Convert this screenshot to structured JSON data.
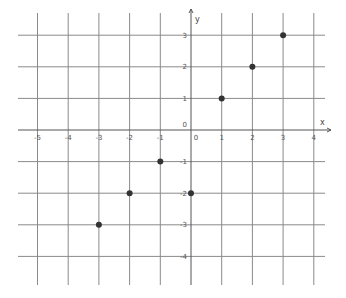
{
  "chart_data": {
    "type": "scatter",
    "title": "",
    "xlabel": "x",
    "ylabel": "y",
    "xlim": [
      -5.7,
      4.4
    ],
    "ylim": [
      -4.9,
      3.7
    ],
    "grid": true,
    "x_ticks": [
      -5,
      -4,
      -3,
      -2,
      -1,
      0,
      1,
      2,
      3,
      4
    ],
    "y_ticks": [
      3,
      2,
      1,
      0,
      -1,
      -2,
      -3,
      -4
    ],
    "x_tick_labels": [
      "-5",
      "-4",
      "-3",
      "-2",
      "-1",
      "0",
      "1",
      "2",
      "3",
      "4"
    ],
    "y_tick_labels": [
      "3",
      "2",
      "1",
      "0",
      "-1",
      "-2",
      "-3",
      "-4"
    ],
    "origin_label": "0",
    "points": [
      {
        "x": 1,
        "y": 1
      },
      {
        "x": 2,
        "y": 2
      },
      {
        "x": 3,
        "y": 3
      },
      {
        "x": -1,
        "y": -1
      },
      {
        "x": -2,
        "y": -2
      },
      {
        "x": -3,
        "y": -3
      },
      {
        "x": 0,
        "y": -2
      }
    ],
    "point_color": "#333333",
    "grid_color": "#8a8a8a",
    "axis_color": "#555555"
  }
}
